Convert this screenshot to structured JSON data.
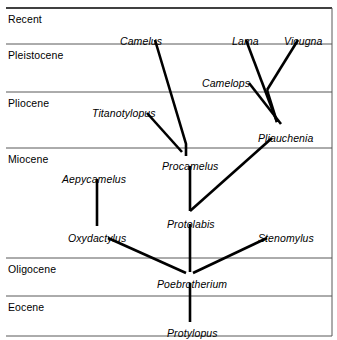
{
  "figure": {
    "kind": "phylogenetic-tree",
    "width": 337,
    "height": 340,
    "background_color": "#ffffff",
    "line_color": "#000000",
    "axis_line_color": "#595959"
  },
  "epochs": [
    {
      "id": "recent",
      "label": "Recent",
      "label_x": 8,
      "label_y": 13,
      "boundary_y": 8
    },
    {
      "id": "pleistocene",
      "label": "Pleistocene",
      "label_x": 8,
      "label_y": 49,
      "boundary_y": 44
    },
    {
      "id": "pliocene",
      "label": "Pliocene",
      "label_x": 8,
      "label_y": 97,
      "boundary_y": 92
    },
    {
      "id": "miocene",
      "label": "Miocene",
      "label_x": 8,
      "label_y": 153,
      "boundary_y": 148
    },
    {
      "id": "oligocene",
      "label": "Oligocene",
      "label_x": 8,
      "label_y": 263,
      "boundary_y": 258
    },
    {
      "id": "eocene",
      "label": "Eocene",
      "label_x": 8,
      "label_y": 301,
      "boundary_y": 296
    }
  ],
  "boundary_line": {
    "x_start": 6,
    "x_end": 332,
    "bottom_y": 336
  },
  "frame": {
    "right_border_x": 332,
    "right_border_y1": 8,
    "right_border_y2": 336
  },
  "taxa": [
    {
      "id": "camelus",
      "label": "Camelus",
      "label_x": 120,
      "label_y": 35,
      "node_x": 155,
      "node_y": 38
    },
    {
      "id": "lama",
      "label": "Lama",
      "label_x": 232,
      "label_y": 35,
      "node_x": 249,
      "node_y": 38
    },
    {
      "id": "vicugna",
      "label": "Vicugna",
      "label_x": 284,
      "label_y": 35,
      "node_x": 298,
      "node_y": 38
    },
    {
      "id": "camelops",
      "label": "Camelops",
      "label_x": 202,
      "label_y": 77,
      "node_x": 250,
      "node_y": 80
    },
    {
      "id": "titanotylopus",
      "label": "Titanotylopus",
      "label_x": 92,
      "label_y": 107,
      "node_x": 153,
      "node_y": 110
    },
    {
      "id": "pliauchenia",
      "label": "Pliauchenia",
      "label_x": 258,
      "label_y": 132,
      "node_x": 276,
      "node_y": 135
    },
    {
      "id": "procamelus",
      "label": "Procamelus",
      "label_x": 162,
      "label_y": 160,
      "node_x": 189,
      "node_y": 163
    },
    {
      "id": "aepycamelus",
      "label": "Aepycamelus",
      "label_x": 62,
      "label_y": 173,
      "node_x": 96,
      "node_y": 176
    },
    {
      "id": "protolabis",
      "label": "Protolabis",
      "label_x": 167,
      "label_y": 218,
      "node_x": 190,
      "node_y": 221
    },
    {
      "id": "oxydactylus",
      "label": "Oxydactylus",
      "label_x": 68,
      "label_y": 232,
      "node_x": 97,
      "node_y": 235
    },
    {
      "id": "stenomylus",
      "label": "Stenomylus",
      "label_x": 258,
      "label_y": 232,
      "node_x": 275,
      "node_y": 235
    },
    {
      "id": "poebrotherium",
      "label": "Poebrotherium",
      "label_x": 157,
      "label_y": 278,
      "node_x": 190,
      "node_y": 281
    },
    {
      "id": "protylopus",
      "label": "Protylopus",
      "label_x": 167,
      "label_y": 327,
      "node_x": 190,
      "node_y": 330
    }
  ],
  "branches": [
    {
      "id": "camelus-to-procamelus",
      "from": "camelus",
      "to": "procamelus",
      "points": "155,40 186,144 186,156"
    },
    {
      "id": "lama-to-junction",
      "from": "lama",
      "to": "lama-vicugna-junction",
      "points": "246,40 277,122"
    },
    {
      "id": "vicugna-to-junction",
      "from": "vicugna",
      "to": "lama-vicugna-junction",
      "points": "298,40 267,90"
    },
    {
      "id": "junction-to-pliauchenia",
      "from": "lama-vicugna-junction",
      "to": "pliauchenia",
      "points": "267,90 277,122"
    },
    {
      "id": "camelops-to-pliauchenia",
      "from": "camelops",
      "to": "pliauchenia",
      "points": "249,83 281,124"
    },
    {
      "id": "titanotylopus-to-procamelus",
      "from": "titanotylopus",
      "to": "procamelus",
      "points": "147,113 182,152"
    },
    {
      "id": "pliauchenia-to-protolabis",
      "from": "pliauchenia",
      "to": "protolabis",
      "points": "272,138 190,211"
    },
    {
      "id": "procamelus-to-protolabis",
      "from": "procamelus",
      "to": "protolabis",
      "points": "190,166 190,211"
    },
    {
      "id": "aepycamelus-to-oxydactylus",
      "from": "aepycamelus",
      "to": "oxydactylus",
      "points": "97,179 97,226"
    },
    {
      "id": "oxydactylus-to-poebrotherium",
      "from": "oxydactylus",
      "to": "poebrotherium",
      "points": "108,238 186,273"
    },
    {
      "id": "stenomylus-to-poebrotherium",
      "from": "stenomylus",
      "to": "poebrotherium",
      "points": "267,238 193,273"
    },
    {
      "id": "protolabis-to-poebrotherium",
      "from": "protolabis",
      "to": "poebrotherium",
      "points": "190,224 190,272"
    },
    {
      "id": "poebrotherium-to-protylopus",
      "from": "poebrotherium",
      "to": "protylopus",
      "points": "190,283 190,322"
    }
  ]
}
